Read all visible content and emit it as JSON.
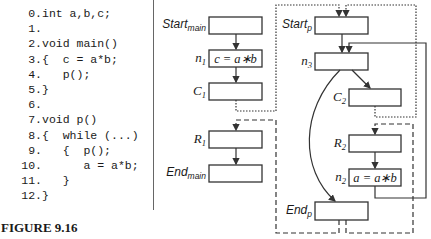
{
  "code": {
    "lines": [
      {
        "num": "0.",
        "text": "int a,b,c;"
      },
      {
        "num": "1.",
        "text": ""
      },
      {
        "num": "2.",
        "text": "void main()"
      },
      {
        "num": "3.",
        "text": "{  c = a*b;"
      },
      {
        "num": "4.",
        "text": "   p();"
      },
      {
        "num": "5.",
        "text": "}"
      },
      {
        "num": "6.",
        "text": ""
      },
      {
        "num": "7.",
        "text": "void p()"
      },
      {
        "num": "8.",
        "text": "{  while (...)"
      },
      {
        "num": "9.",
        "text": "   {  p();"
      },
      {
        "num": "10.",
        "text": "      a = a*b;"
      },
      {
        "num": "11.",
        "text": "   }"
      },
      {
        "num": "12.",
        "text": "}"
      }
    ]
  },
  "figure_caption": "FIGURE 9.16",
  "diagram": {
    "main": {
      "start": {
        "label": "Start",
        "sub": "main",
        "content": ""
      },
      "n1": {
        "label": "n",
        "sub": "1",
        "content": "c = a∗b"
      },
      "c1": {
        "label": "C",
        "sub": "1",
        "content": ""
      },
      "r1": {
        "label": "R",
        "sub": "1",
        "content": ""
      },
      "end": {
        "label": "End",
        "sub": "main",
        "content": ""
      }
    },
    "p": {
      "start": {
        "label": "Start",
        "sub": "p",
        "content": ""
      },
      "n3": {
        "label": "n",
        "sub": "3",
        "content": ""
      },
      "c2": {
        "label": "C",
        "sub": "2",
        "content": ""
      },
      "r2": {
        "label": "R",
        "sub": "2",
        "content": ""
      },
      "n2": {
        "label": "n",
        "sub": "2",
        "content": "a = a∗b"
      },
      "end": {
        "label": "End",
        "sub": "p",
        "content": ""
      }
    },
    "edge_styles": {
      "intraprocedural": "solid",
      "call": "dotted",
      "return": "dashed"
    }
  }
}
